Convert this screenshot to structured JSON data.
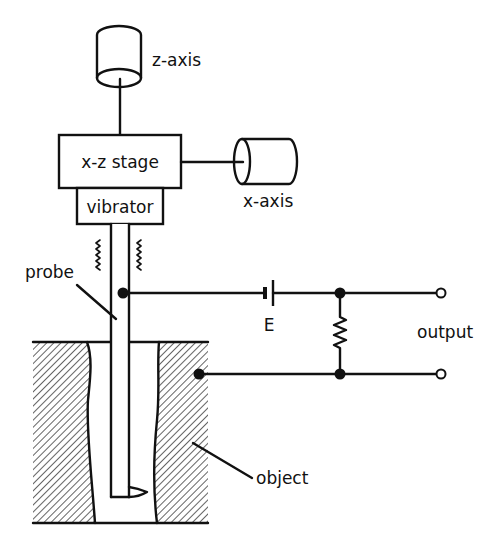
{
  "diagram": {
    "type": "schematic",
    "labels": {
      "z_axis": "z-axis",
      "x_axis": "x-axis",
      "stage": "x-z stage",
      "vibrator": "vibrator",
      "probe": "probe",
      "battery": "E",
      "output": "output",
      "object": "object"
    },
    "components": [
      {
        "id": "z-axis-actuator",
        "shape": "vertical-cylinder",
        "label": "z-axis"
      },
      {
        "id": "x-axis-actuator",
        "shape": "horizontal-cylinder",
        "label": "x-axis"
      },
      {
        "id": "xz-stage",
        "shape": "rectangle",
        "label": "x-z stage"
      },
      {
        "id": "vibrator",
        "shape": "rectangle",
        "label": "vibrator"
      },
      {
        "id": "probe",
        "shape": "long-rod-with-tip",
        "label": "probe"
      },
      {
        "id": "battery",
        "shape": "dc-source",
        "label": "E"
      },
      {
        "id": "resistor",
        "shape": "resistor-zigzag"
      },
      {
        "id": "object",
        "shape": "hatched-block-with-cavity",
        "label": "object"
      },
      {
        "id": "output-terminals",
        "shape": "two-open-circles",
        "label": "output"
      }
    ],
    "connections": [
      [
        "z-axis-actuator",
        "xz-stage"
      ],
      [
        "x-axis-actuator",
        "xz-stage"
      ],
      [
        "xz-stage",
        "vibrator"
      ],
      [
        "vibrator",
        "probe"
      ],
      [
        "probe",
        "battery"
      ],
      [
        "battery",
        "resistor-top"
      ],
      [
        "resistor-top",
        "output-terminal-top"
      ],
      [
        "object",
        "resistor-bottom"
      ],
      [
        "resistor-bottom",
        "output-terminal-bottom"
      ]
    ],
    "colors": {
      "stroke": "#111111",
      "background": "#ffffff"
    }
  }
}
